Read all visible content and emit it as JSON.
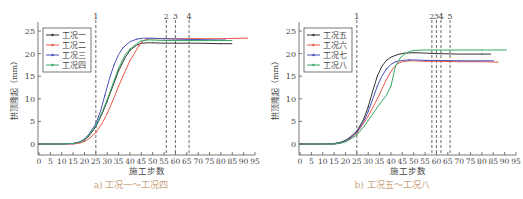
{
  "chart_data": [
    {
      "type": "line",
      "panel": "a",
      "caption": "a) 工况一～工况四",
      "xlabel": "施工步数",
      "ylabel": "拱顶隆起（mm）",
      "xlim": [
        0,
        95
      ],
      "ylim": [
        -2.5,
        26
      ],
      "xticks": [
        0,
        5,
        10,
        15,
        20,
        25,
        30,
        35,
        40,
        45,
        50,
        55,
        60,
        65,
        70,
        75,
        80,
        85,
        90,
        95
      ],
      "yticks": [
        0,
        5,
        10,
        15,
        20,
        25
      ],
      "grid": false,
      "legend_position": "upper left",
      "vlines": [
        {
          "x": 25,
          "label": "1"
        },
        {
          "x": 56,
          "label": "2"
        },
        {
          "x": 60,
          "label": "3"
        },
        {
          "x": 66,
          "label": "4"
        }
      ],
      "series": [
        {
          "name": "工况一",
          "color": "#333333",
          "x": [
            0,
            10,
            15,
            18,
            20,
            22,
            25,
            28,
            30,
            33,
            35,
            38,
            40,
            43,
            45,
            48,
            50,
            55,
            60,
            70,
            80,
            85
          ],
          "y": [
            0,
            0,
            0.1,
            0.4,
            0.9,
            1.8,
            3.8,
            7.0,
            9.5,
            13.5,
            16.2,
            19.2,
            20.7,
            21.9,
            22.3,
            22.4,
            22.4,
            22.3,
            22.3,
            22.3,
            22.2,
            22.2
          ]
        },
        {
          "name": "工况二",
          "color": "#e8584a",
          "x": [
            0,
            10,
            15,
            18,
            20,
            22,
            25,
            28,
            30,
            33,
            35,
            38,
            40,
            42,
            44,
            46,
            48,
            50,
            55,
            60,
            70,
            80,
            90,
            92
          ],
          "y": [
            0,
            0,
            0,
            0.2,
            0.6,
            1.2,
            2.5,
            4.8,
            6.8,
            10.2,
            12.8,
            16.2,
            18.4,
            20.1,
            21.8,
            22.9,
            23.2,
            23.3,
            23.3,
            23.3,
            23.3,
            23.3,
            23.4,
            23.4
          ]
        },
        {
          "name": "工况三",
          "color": "#4a52b8",
          "x": [
            0,
            10,
            15,
            18,
            20,
            22,
            25,
            27,
            29,
            31,
            33,
            35,
            37,
            40,
            43,
            46,
            48,
            50,
            55,
            60,
            70,
            80,
            82
          ],
          "y": [
            0,
            0,
            0.1,
            0.5,
            1.1,
            2.2,
            4.5,
            7.2,
            10.8,
            14.5,
            17.5,
            19.8,
            21.3,
            22.6,
            23.2,
            23.4,
            23.4,
            23.4,
            23.3,
            23.2,
            23.1,
            23.0,
            23.0
          ]
        },
        {
          "name": "工况四",
          "color": "#3aa866",
          "x": [
            0,
            10,
            15,
            18,
            20,
            22,
            25,
            28,
            30,
            33,
            35,
            38,
            40,
            43,
            45,
            48,
            50,
            55,
            60,
            70,
            80,
            85
          ],
          "y": [
            0,
            0,
            0.1,
            0.4,
            1.0,
            2.0,
            4.0,
            7.4,
            9.8,
            14.0,
            16.8,
            19.8,
            21.0,
            22.2,
            22.8,
            23.0,
            23.0,
            22.9,
            22.9,
            22.9,
            22.9,
            22.9
          ]
        }
      ]
    },
    {
      "type": "line",
      "panel": "b",
      "caption": "b) 工况五～工况八",
      "xlabel": "施工步数",
      "ylabel": "拱顶隆起（mm）",
      "xlim": [
        0,
        95
      ],
      "ylim": [
        -2.5,
        26
      ],
      "xticks": [
        0,
        5,
        10,
        15,
        20,
        25,
        30,
        35,
        40,
        45,
        50,
        55,
        60,
        65,
        70,
        75,
        80,
        85,
        90,
        95
      ],
      "yticks": [
        0,
        5,
        10,
        15,
        20,
        25
      ],
      "grid": false,
      "legend_position": "upper left",
      "vlines": [
        {
          "x": 25,
          "label": "1"
        },
        {
          "x": 58,
          "label": "2"
        },
        {
          "x": 60,
          "label": "3"
        },
        {
          "x": 62,
          "label": "4"
        },
        {
          "x": 66,
          "label": "5"
        }
      ],
      "series": [
        {
          "name": "工况五",
          "color": "#333333",
          "x": [
            0,
            10,
            15,
            18,
            20,
            22,
            25,
            28,
            30,
            32,
            34,
            36,
            38,
            40,
            43,
            46,
            50,
            55,
            60,
            70,
            80,
            84
          ],
          "y": [
            0,
            0,
            0.1,
            0.4,
            0.8,
            1.5,
            2.8,
            5.5,
            8.2,
            11.8,
            15.0,
            17.2,
            18.5,
            19.2,
            19.8,
            20.1,
            20.2,
            20.1,
            20.0,
            19.9,
            19.9,
            19.9
          ]
        },
        {
          "name": "工况六",
          "color": "#e8584a",
          "x": [
            0,
            10,
            15,
            18,
            20,
            22,
            25,
            28,
            30,
            33,
            35,
            37,
            39,
            41,
            43,
            45,
            48,
            50,
            55,
            60,
            70,
            80,
            87
          ],
          "y": [
            0,
            0,
            0,
            0.2,
            0.6,
            1.2,
            2.4,
            4.6,
            6.2,
            9.0,
            11.0,
            13.2,
            15.2,
            16.8,
            17.8,
            18.2,
            18.4,
            18.4,
            18.3,
            18.3,
            18.2,
            18.2,
            18.1
          ]
        },
        {
          "name": "工况七",
          "color": "#4a52b8",
          "x": [
            0,
            10,
            15,
            18,
            20,
            22,
            25,
            28,
            30,
            32,
            34,
            36,
            38,
            40,
            42,
            45,
            48,
            50,
            55,
            60,
            70,
            80,
            85
          ],
          "y": [
            0,
            0,
            0,
            0.3,
            0.7,
            1.3,
            2.6,
            5.0,
            7.2,
            10.0,
            12.8,
            15.0,
            16.6,
            17.6,
            18.2,
            18.5,
            18.6,
            18.6,
            18.5,
            18.5,
            18.4,
            18.4,
            18.4
          ]
        },
        {
          "name": "工况八",
          "color": "#3aa866",
          "x": [
            0,
            10,
            15,
            18,
            20,
            22,
            25,
            28,
            30,
            33,
            35,
            38,
            40,
            41,
            42,
            44,
            46,
            48,
            50,
            55,
            60,
            70,
            80,
            91
          ],
          "y": [
            0,
            0,
            0,
            0.2,
            0.5,
            1.0,
            2.0,
            3.8,
            5.2,
            7.4,
            8.8,
            10.8,
            12.8,
            15.0,
            17.2,
            19.0,
            19.9,
            20.4,
            20.7,
            20.8,
            20.8,
            20.8,
            20.8,
            20.8
          ]
        }
      ]
    }
  ]
}
